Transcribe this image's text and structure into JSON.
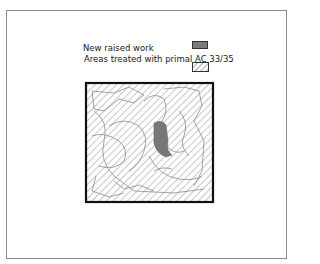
{
  "legend": {
    "items": [
      {
        "label": "New raised work",
        "swatch": "solid-gray",
        "color": "#7a7a7a"
      },
      {
        "label": "Areas treated with primal AC 33/35",
        "swatch": "diagonal-hatch",
        "color": "#888888"
      }
    ]
  },
  "diagram": {
    "border_color": "#111111",
    "hatch_color": "#9a9a9a",
    "fill_color": "#777777"
  }
}
